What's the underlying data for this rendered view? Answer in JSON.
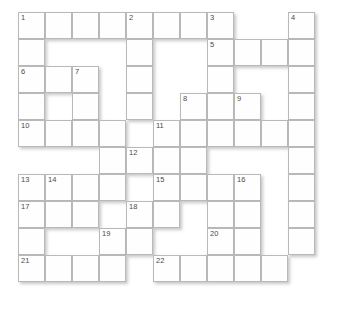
{
  "puzzle": {
    "title": "Crossword Grid",
    "type": "crossword",
    "columns": 11,
    "rows": 10,
    "cell_size": 27,
    "origin_x": 18,
    "origin_y": 12,
    "colors": {
      "cell_fill": "#fefefe",
      "cell_border": "#b9b9b9",
      "number_text": "#4a4a4a",
      "page_background": "#ffffff",
      "shadow": "rgba(120,120,120,0.42)"
    },
    "numbers": [
      {
        "label": "1",
        "col": 0,
        "row": 0
      },
      {
        "label": "2",
        "col": 4,
        "row": 0
      },
      {
        "label": "3",
        "col": 7,
        "row": 0
      },
      {
        "label": "4",
        "col": 10,
        "row": 0
      },
      {
        "label": "5",
        "col": 7,
        "row": 1
      },
      {
        "label": "6",
        "col": 0,
        "row": 2
      },
      {
        "label": "7",
        "col": 2,
        "row": 2
      },
      {
        "label": "8",
        "col": 6,
        "row": 3
      },
      {
        "label": "9",
        "col": 8,
        "row": 3
      },
      {
        "label": "10",
        "col": 0,
        "row": 4
      },
      {
        "label": "11",
        "col": 5,
        "row": 4
      },
      {
        "label": "12",
        "col": 4,
        "row": 5
      },
      {
        "label": "13",
        "col": 0,
        "row": 6
      },
      {
        "label": "14",
        "col": 1,
        "row": 6
      },
      {
        "label": "15",
        "col": 5,
        "row": 6
      },
      {
        "label": "16",
        "col": 8,
        "row": 6
      },
      {
        "label": "17",
        "col": 0,
        "row": 7
      },
      {
        "label": "18",
        "col": 4,
        "row": 7
      },
      {
        "label": "19",
        "col": 3,
        "row": 8
      },
      {
        "label": "20",
        "col": 7,
        "row": 8
      },
      {
        "label": "21",
        "col": 0,
        "row": 9
      },
      {
        "label": "22",
        "col": 5,
        "row": 9
      }
    ],
    "cells": [
      {
        "row": 0,
        "cols": [
          0,
          1,
          2,
          3,
          4,
          5,
          6,
          7,
          10
        ]
      },
      {
        "row": 1,
        "cols": [
          0,
          4,
          7,
          8,
          9,
          10
        ]
      },
      {
        "row": 2,
        "cols": [
          0,
          1,
          2,
          4,
          7,
          10
        ]
      },
      {
        "row": 3,
        "cols": [
          0,
          2,
          4,
          6,
          7,
          8,
          10
        ]
      },
      {
        "row": 4,
        "cols": [
          0,
          1,
          2,
          3,
          5,
          6,
          7,
          8,
          9,
          10
        ]
      },
      {
        "row": 5,
        "cols": [
          3,
          4,
          5,
          6,
          10
        ]
      },
      {
        "row": 6,
        "cols": [
          0,
          1,
          2,
          3,
          5,
          6,
          7,
          8,
          10
        ]
      },
      {
        "row": 7,
        "cols": [
          0,
          1,
          2,
          4,
          5,
          7,
          8,
          10
        ]
      },
      {
        "row": 8,
        "cols": [
          0,
          3,
          4,
          7,
          8,
          10
        ]
      },
      {
        "row": 9,
        "cols": [
          0,
          1,
          2,
          3,
          5,
          6,
          7,
          8,
          9
        ]
      }
    ]
  }
}
